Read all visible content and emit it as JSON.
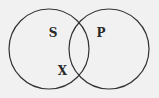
{
  "diagram": {
    "type": "venn",
    "background": "#f1f1f1",
    "stroke_color": "#333333",
    "sets": [
      {
        "name": "S",
        "label": "S",
        "cx": 49,
        "cy": 49,
        "r": 40
      },
      {
        "name": "P",
        "label": "P",
        "cx": 109,
        "cy": 49,
        "r": 40
      }
    ],
    "marks": [
      {
        "label": "X",
        "region": "S only, near intersection boundary"
      }
    ]
  }
}
